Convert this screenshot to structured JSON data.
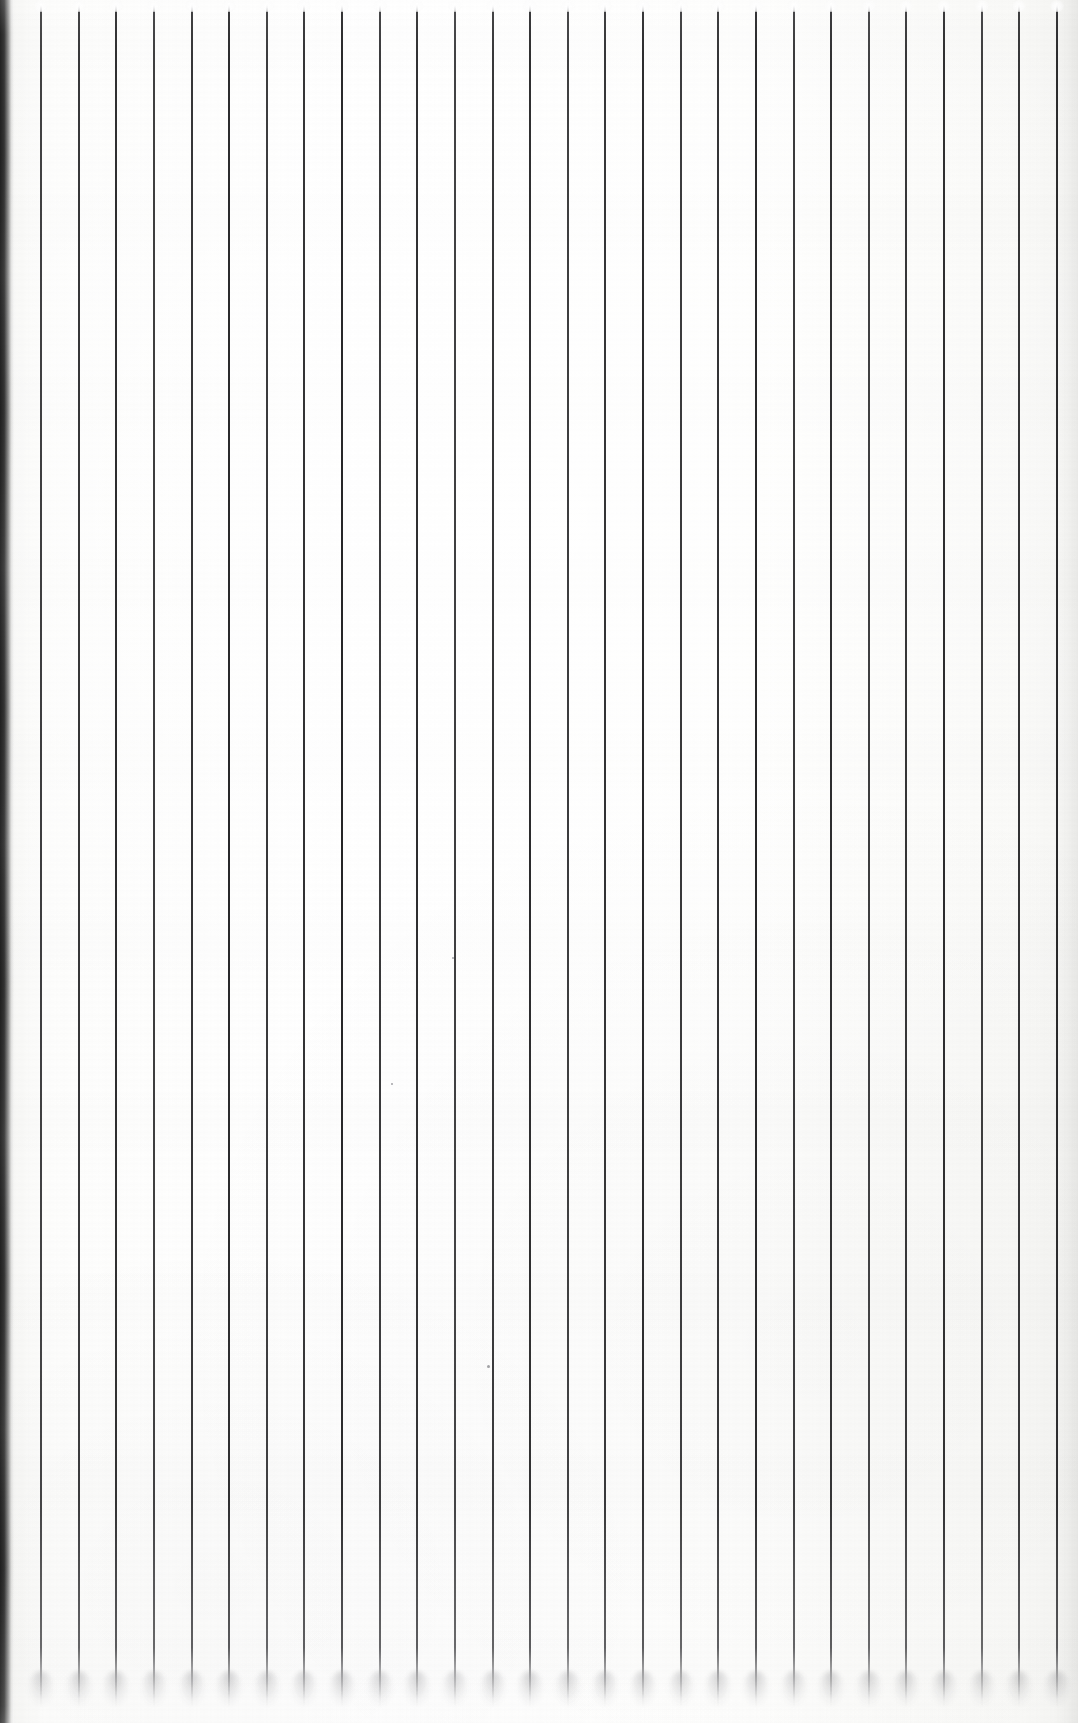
{
  "document": {
    "kind": "scanned-ruled-paper",
    "description": "Blank sheet of vertically ruled (columnar) paper, scanned",
    "page_width": 1078,
    "page_height": 1723,
    "visible_text": "",
    "has_handwriting": false,
    "has_printed_text": false
  },
  "paper": {
    "color": "#fdfdfc",
    "highlight_color": "#ffffff",
    "shade_color": "#f3f3f1"
  },
  "rules": {
    "orientation": "vertical",
    "count": 28,
    "color": "#1c1c1e",
    "thickness_px": 2,
    "first_x": 41,
    "spacing_px": 37.63,
    "top_y": 3,
    "bottom_y": 1707,
    "cap_style": "soft-white-droplet",
    "foot_style": "soft-gray-shadow",
    "positions": [
      41,
      78.6,
      116.3,
      153.9,
      191.5,
      229.1,
      266.8,
      304.4,
      342.0,
      379.6,
      417.3,
      454.9,
      492.5,
      530.1,
      567.8,
      605.4,
      643.0,
      680.6,
      718.3,
      755.9,
      793.5,
      831.1,
      868.8,
      906.4,
      944.0,
      981.6,
      1019.3,
      1056.9
    ]
  },
  "edges": {
    "left_shadow": {
      "present": true,
      "x": 0,
      "width_px": 14,
      "color": "#121212",
      "note": "dark scanner edge shadow running the full height"
    },
    "right_margin": {
      "present": true,
      "width_px": 22,
      "color": "#f2f2f0",
      "note": "slightly gray paper margin beyond the last rule"
    }
  },
  "marks": [
    {
      "name": "dust-speck",
      "x": 487,
      "y": 1365,
      "size_px": 3
    },
    {
      "name": "dust-speck",
      "x": 452,
      "y": 957,
      "size_px": 2
    },
    {
      "name": "dust-speck",
      "x": 391,
      "y": 1083,
      "size_px": 2
    }
  ]
}
